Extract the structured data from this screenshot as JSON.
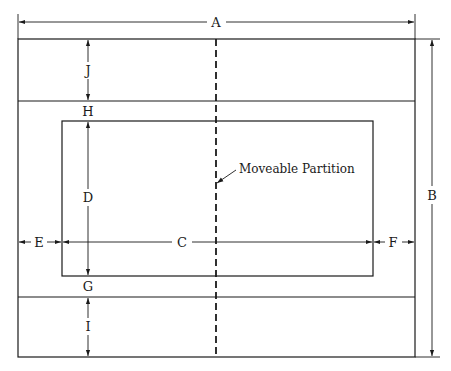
{
  "diagram": {
    "type": "dimensioned floor plan",
    "stroke_color": "#1a1a1a",
    "background": "#ffffff",
    "dimensions": {
      "A": "A",
      "B": "B",
      "C": "C",
      "D": "D",
      "E": "E",
      "F": "F",
      "G": "G",
      "H": "H",
      "I": "I",
      "J": "J"
    },
    "annotation": "Moveable Partition"
  }
}
